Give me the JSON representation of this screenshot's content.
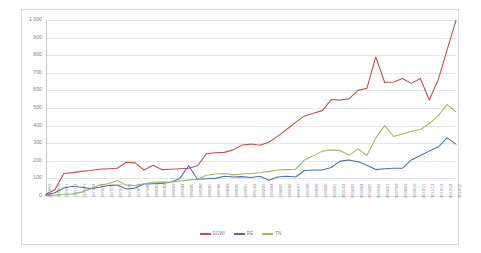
{
  "chart_data": {
    "type": "line",
    "title": "",
    "xlabel": "",
    "ylabel": "",
    "ylim": [
      0,
      1000
    ],
    "ytick_step": 100,
    "ytick_labels": [
      "1 000",
      "900",
      "800",
      "700",
      "600",
      "500",
      "400",
      "300",
      "200",
      "100",
      "0"
    ],
    "grid": "horizontal",
    "legend_position": "bottom",
    "categories": [
      "1968/69",
      "1969/70",
      "1970/71",
      "1971/72",
      "1972/73",
      "1973/74",
      "1974/75",
      "1975/76",
      "1976/77",
      "1977/78",
      "1978/79",
      "1979/80",
      "1980/81",
      "1981/82",
      "1982/83",
      "1983/84",
      "1984/85",
      "1985/86",
      "1986/87",
      "1987/88",
      "1988/89",
      "1989/90",
      "1990/91",
      "1991/92",
      "1992/93",
      "1993/94",
      "1994/95",
      "1995/96",
      "1996/97",
      "1997/98",
      "1998/99",
      "1999/00",
      "2000/01",
      "2001/02",
      "2002/03",
      "2003/04",
      "2004/05",
      "2005/06",
      "2006/07",
      "2007/08",
      "2008/09",
      "2009/10",
      "2010/11",
      "2011/12",
      "2012/13",
      "2013/14",
      "2014/15"
    ],
    "series": [
      {
        "name": "SGWI",
        "color": "#C0504D",
        "values": [
          10,
          35,
          128,
          133,
          140,
          145,
          152,
          155,
          158,
          192,
          188,
          148,
          175,
          150,
          152,
          155,
          158,
          172,
          240,
          246,
          248,
          262,
          290,
          295,
          288,
          305,
          340,
          378,
          418,
          455,
          470,
          485,
          548,
          545,
          552,
          600,
          612,
          790,
          645,
          648,
          668,
          640,
          668,
          545,
          660,
          830,
          998
        ]
      },
      {
        "name": "RE",
        "color": "#4F6FA8",
        "values": [
          5,
          18,
          45,
          55,
          50,
          42,
          50,
          60,
          62,
          40,
          45,
          68,
          70,
          72,
          78,
          100,
          172,
          95,
          98,
          100,
          112,
          108,
          110,
          105,
          112,
          90,
          108,
          112,
          108,
          145,
          148,
          148,
          162,
          198,
          205,
          195,
          175,
          150,
          155,
          158,
          158,
          205,
          230,
          255,
          278,
          330,
          295
        ]
      },
      {
        "name": "TN",
        "color": "#9BBB59",
        "values": [
          2,
          5,
          10,
          12,
          22,
          40,
          62,
          70,
          88,
          62,
          60,
          70,
          78,
          80,
          78,
          85,
          90,
          95,
          118,
          125,
          128,
          120,
          125,
          128,
          132,
          140,
          148,
          150,
          152,
          205,
          228,
          255,
          262,
          258,
          232,
          268,
          230,
          330,
          400,
          338,
          352,
          368,
          378,
          412,
          455,
          520,
          478
        ]
      }
    ]
  },
  "legend": {
    "items": [
      {
        "label": "SGWI"
      },
      {
        "label": "RE"
      },
      {
        "label": "TN"
      }
    ]
  }
}
